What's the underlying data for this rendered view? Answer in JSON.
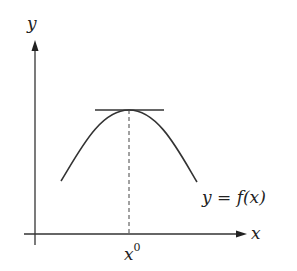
{
  "diagram": {
    "axes": {
      "x_label": "x",
      "y_label": "y"
    },
    "curve_label": "y = f(x)",
    "point_label": {
      "base": "x",
      "superscript": "0"
    },
    "elements": [
      "y-axis with arrow",
      "x-axis with arrow",
      "concave-down curve with maximum",
      "horizontal tangent line at maximum",
      "dashed vertical line from maximum to x-axis"
    ],
    "colors": {
      "stroke": "#333333",
      "background": "#ffffff"
    }
  }
}
